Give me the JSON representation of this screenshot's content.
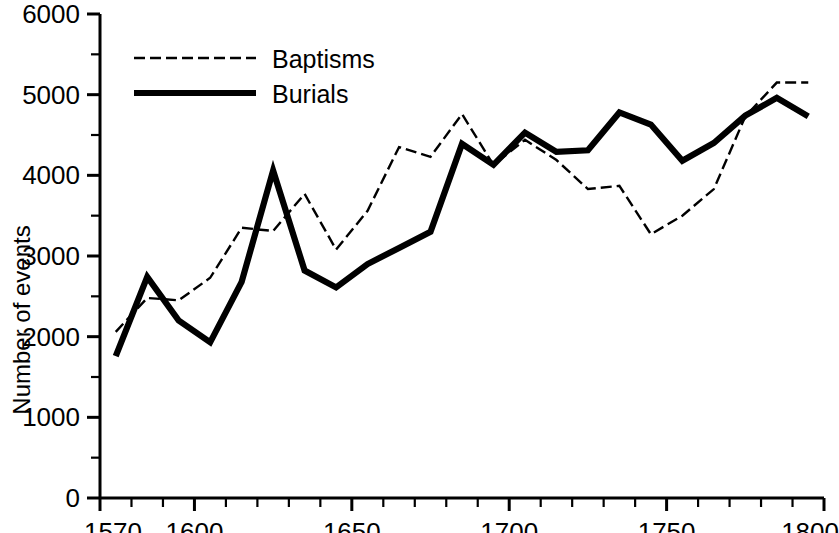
{
  "chart_data": {
    "type": "line",
    "title": "",
    "xlabel": "",
    "ylabel": "Number of events",
    "xlim": [
      1570,
      1800
    ],
    "ylim": [
      0,
      6000
    ],
    "xticks": [
      1570,
      1600,
      1650,
      1700,
      1750,
      1800
    ],
    "xtick_labels": [
      "1570",
      "1600",
      "1650",
      "1700",
      "1750",
      "1800"
    ],
    "yticks": [
      0,
      1000,
      2000,
      3000,
      4000,
      5000,
      6000
    ],
    "ytick_labels": [
      "0",
      "1000",
      "2000",
      "3000",
      "4000",
      "5000",
      "6000"
    ],
    "yminor_ticks": [
      500,
      1500,
      2500,
      3500,
      4500,
      5500
    ],
    "xminor_step": 10,
    "grid": false,
    "legend_position": "top-left",
    "series": [
      {
        "name": "Baptisms",
        "style": "dashed",
        "color": "#000000",
        "x": [
          1575,
          1585,
          1595,
          1605,
          1615,
          1625,
          1635,
          1645,
          1655,
          1665,
          1675,
          1685,
          1695,
          1705,
          1715,
          1725,
          1735,
          1745,
          1755,
          1765,
          1775,
          1785,
          1795
        ],
        "values": [
          2060,
          2480,
          2450,
          2730,
          3350,
          3310,
          3770,
          3080,
          3560,
          4350,
          4230,
          4760,
          4130,
          4440,
          4190,
          3830,
          3870,
          3270,
          3500,
          3830,
          4730,
          5150,
          5150
        ]
      },
      {
        "name": "Burials",
        "style": "solid",
        "color": "#000000",
        "x": [
          1575,
          1585,
          1595,
          1605,
          1615,
          1625,
          1635,
          1645,
          1655,
          1665,
          1675,
          1685,
          1695,
          1705,
          1715,
          1725,
          1735,
          1745,
          1755,
          1765,
          1775,
          1785,
          1795
        ],
        "values": [
          1760,
          2740,
          2200,
          1930,
          2680,
          4060,
          2820,
          2610,
          2900,
          3100,
          3300,
          4390,
          4130,
          4530,
          4290,
          4310,
          4780,
          4630,
          4180,
          4400,
          4740,
          4960,
          4730
        ]
      }
    ]
  },
  "legend": {
    "items": [
      {
        "label": "Baptisms",
        "style": "dashed"
      },
      {
        "label": "Burials",
        "style": "solid"
      }
    ]
  },
  "axes": {
    "y_title": "Number of events"
  }
}
